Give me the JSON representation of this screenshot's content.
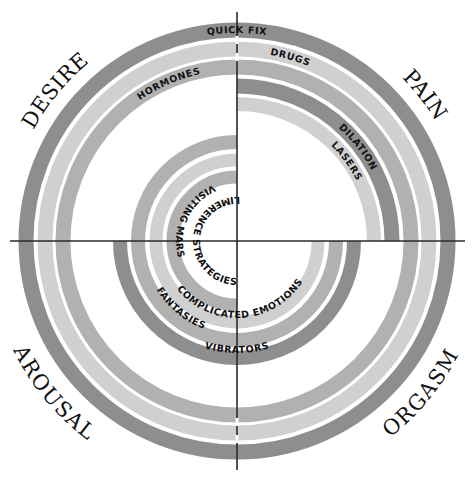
{
  "diagram": {
    "type": "concentric-arc-diagram",
    "center": {
      "x": 237,
      "y": 241
    },
    "colors": {
      "dark": "#8e8e8e",
      "medium": "#b1b1b1",
      "light": "#d0d0d0",
      "axis": "#2a2a2a",
      "text": "#111111"
    },
    "quadrants": {
      "top_left": "DESIRE",
      "top_right": "PAIN",
      "bottom_left": "AROUSAL",
      "bottom_right": "ORGASM"
    },
    "rings": [
      {
        "label": "QUICK FIX",
        "radius": 211,
        "shade": "dark",
        "span": "full circle"
      },
      {
        "label": "DRUGS",
        "radius": 192,
        "shade": "light",
        "span": "full circle"
      },
      {
        "label": "HORMONES",
        "radius": 174,
        "shade": "medium",
        "span": "full circle"
      },
      {
        "label": "DILATION",
        "radius": 155,
        "shade": "dark",
        "span": "top-right quadrant"
      },
      {
        "label": "LASERS",
        "radius": 137,
        "shade": "light",
        "span": "top-right quadrant"
      },
      {
        "label": "VIBRATORS",
        "radius": 117,
        "shade": "dark",
        "span": "bottom half"
      },
      {
        "label": "FANTASIES",
        "radius": 99,
        "shade": "medium",
        "span": "top-left, bottom-left, bottom-right"
      },
      {
        "label": "COMPLICATED EMOTIONS",
        "radius": 81,
        "shade": "light",
        "span": "top-left, bottom-left, bottom-right"
      },
      {
        "label": "VISITING MARS",
        "radius": 64,
        "shade": "medium",
        "span": "left half"
      },
      {
        "label": "LIMERENCE STRATEGIES",
        "radius": 47,
        "shade": "none",
        "span": "left half"
      }
    ]
  }
}
